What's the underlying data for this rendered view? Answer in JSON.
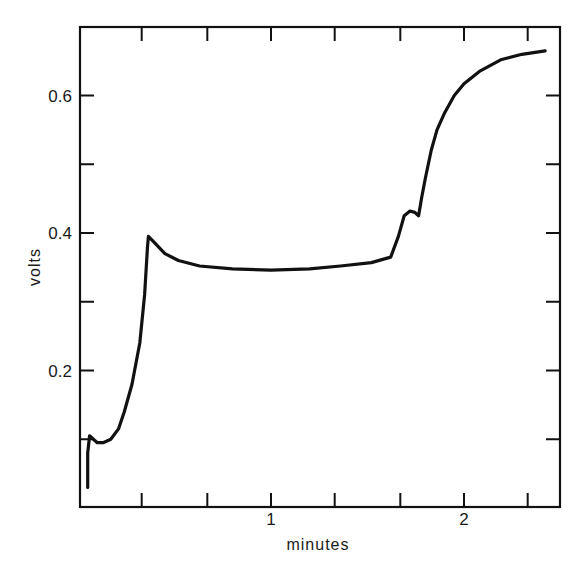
{
  "chart_data": {
    "type": "line",
    "title": "",
    "xlabel": "minutes",
    "ylabel": "volts",
    "xlim": [
      0,
      2.5
    ],
    "ylim": [
      0,
      0.7
    ],
    "grid": false,
    "legend": null,
    "x_ticks": {
      "major": [
        1,
        2
      ],
      "major_labels": [
        "1",
        "2"
      ],
      "minor": [
        0.33,
        0.67,
        1.33,
        1.67,
        2.33
      ]
    },
    "y_ticks": {
      "major": [
        0.2,
        0.4,
        0.6
      ],
      "major_labels": [
        "0.2",
        "0.4",
        "0.6"
      ],
      "minor": [
        0.1,
        0.3,
        0.5
      ]
    },
    "series": [
      {
        "name": "voltage",
        "color": "#111111",
        "x": [
          0.05,
          0.05,
          0.06,
          0.08,
          0.1,
          0.13,
          0.17,
          0.21,
          0.24,
          0.28,
          0.32,
          0.345,
          0.36,
          0.365,
          0.4,
          0.45,
          0.52,
          0.63,
          0.8,
          1.0,
          1.2,
          1.36,
          1.52,
          1.62,
          1.66,
          1.69,
          1.72,
          1.745,
          1.765,
          1.78,
          1.8,
          1.83,
          1.86,
          1.9,
          1.95,
          2.0,
          2.08,
          2.19,
          2.3,
          2.42
        ],
        "y": [
          0.03,
          0.08,
          0.105,
          0.1,
          0.095,
          0.095,
          0.1,
          0.115,
          0.14,
          0.18,
          0.24,
          0.31,
          0.38,
          0.395,
          0.385,
          0.37,
          0.36,
          0.352,
          0.348,
          0.346,
          0.348,
          0.352,
          0.357,
          0.365,
          0.395,
          0.425,
          0.432,
          0.43,
          0.425,
          0.45,
          0.48,
          0.52,
          0.55,
          0.575,
          0.6,
          0.617,
          0.635,
          0.652,
          0.66,
          0.665
        ]
      }
    ]
  }
}
